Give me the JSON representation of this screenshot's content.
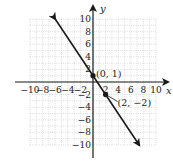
{
  "chart_data": {
    "type": "line",
    "title": "",
    "xlabel": "x",
    "ylabel": "y",
    "xlim": [
      -10,
      10
    ],
    "ylim": [
      -10,
      10
    ],
    "grid": true,
    "x_ticks": [
      -10,
      -8,
      -6,
      -4,
      -2,
      2,
      4,
      6,
      8,
      10
    ],
    "y_ticks": [
      10,
      8,
      6,
      4,
      2,
      -2,
      -4,
      -6,
      -8,
      -10
    ],
    "x_tick_labels": [
      "−10",
      "−8",
      "−6",
      "−4",
      "−2",
      "2",
      "4",
      "6",
      "8",
      "10"
    ],
    "y_tick_labels": [
      "10",
      "8",
      "6",
      "4",
      "2",
      "−2",
      "−4",
      "−6",
      "−8",
      "−10"
    ],
    "series": [
      {
        "name": "line",
        "equation": "y = -3/2 x + 1",
        "x": [
          -6,
          7.33
        ],
        "y": [
          10,
          -10
        ],
        "arrows": "both"
      }
    ],
    "points": [
      {
        "x": 0,
        "y": 1,
        "label": "(0, 1)"
      },
      {
        "x": 2,
        "y": -2,
        "label": "(2, −2)"
      }
    ]
  }
}
